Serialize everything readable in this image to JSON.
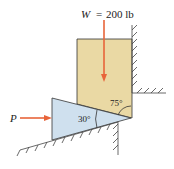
{
  "diagram": {
    "weight_label": "W",
    "weight_eq": "=",
    "weight_value": "200 lb",
    "force_label": "P",
    "wedge_angle": "30°",
    "block_angle": "75°",
    "colors": {
      "block": "#ead9a4",
      "wedge": "#cfe0ee",
      "arrow": "#e8643a",
      "line": "#333333"
    }
  }
}
